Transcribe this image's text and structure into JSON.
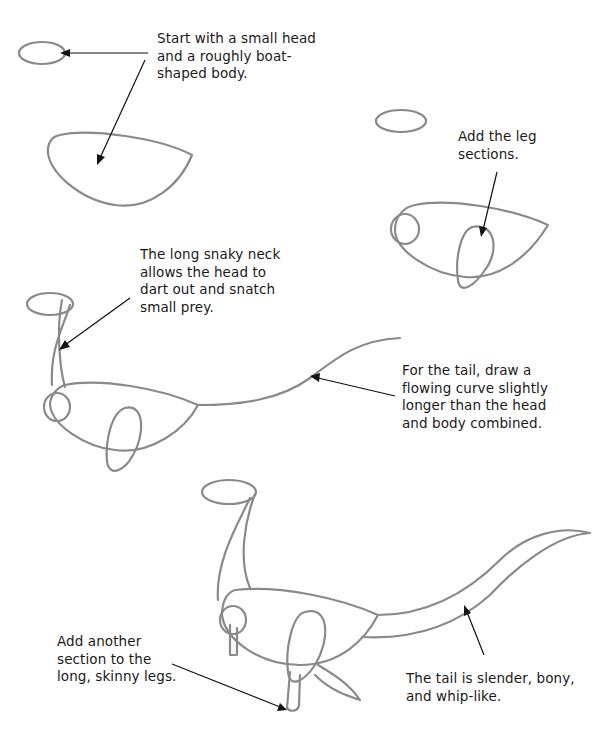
{
  "page": {
    "background": "#ffffff",
    "text_color": "#1a1a1a",
    "sketch_color": "#8a8a8a"
  },
  "steps": [
    {
      "id": "step1",
      "caption": "Start with a small head\nand a roughly boat-\nshaped body.",
      "figure": "head-oval-and-boat-body"
    },
    {
      "id": "step2",
      "caption": "Add the leg\nsections.",
      "figure": "body-with-leg-ovals"
    },
    {
      "id": "step3",
      "caption": "The long snaky neck\nallows the head to\ndart out and snatch\nsmall prey.",
      "figure": "neck-and-head"
    },
    {
      "id": "step4",
      "caption": "For the tail, draw a\nflowing curve slightly\nlonger than the head\nand body combined.",
      "figure": "tail-curve"
    },
    {
      "id": "step5",
      "caption": "Add another\nsection to the\nlong, skinny legs.",
      "figure": "lower-legs"
    },
    {
      "id": "step6",
      "caption": "The tail is slender, bony,\nand whip-like.",
      "figure": "thick-tail"
    }
  ]
}
